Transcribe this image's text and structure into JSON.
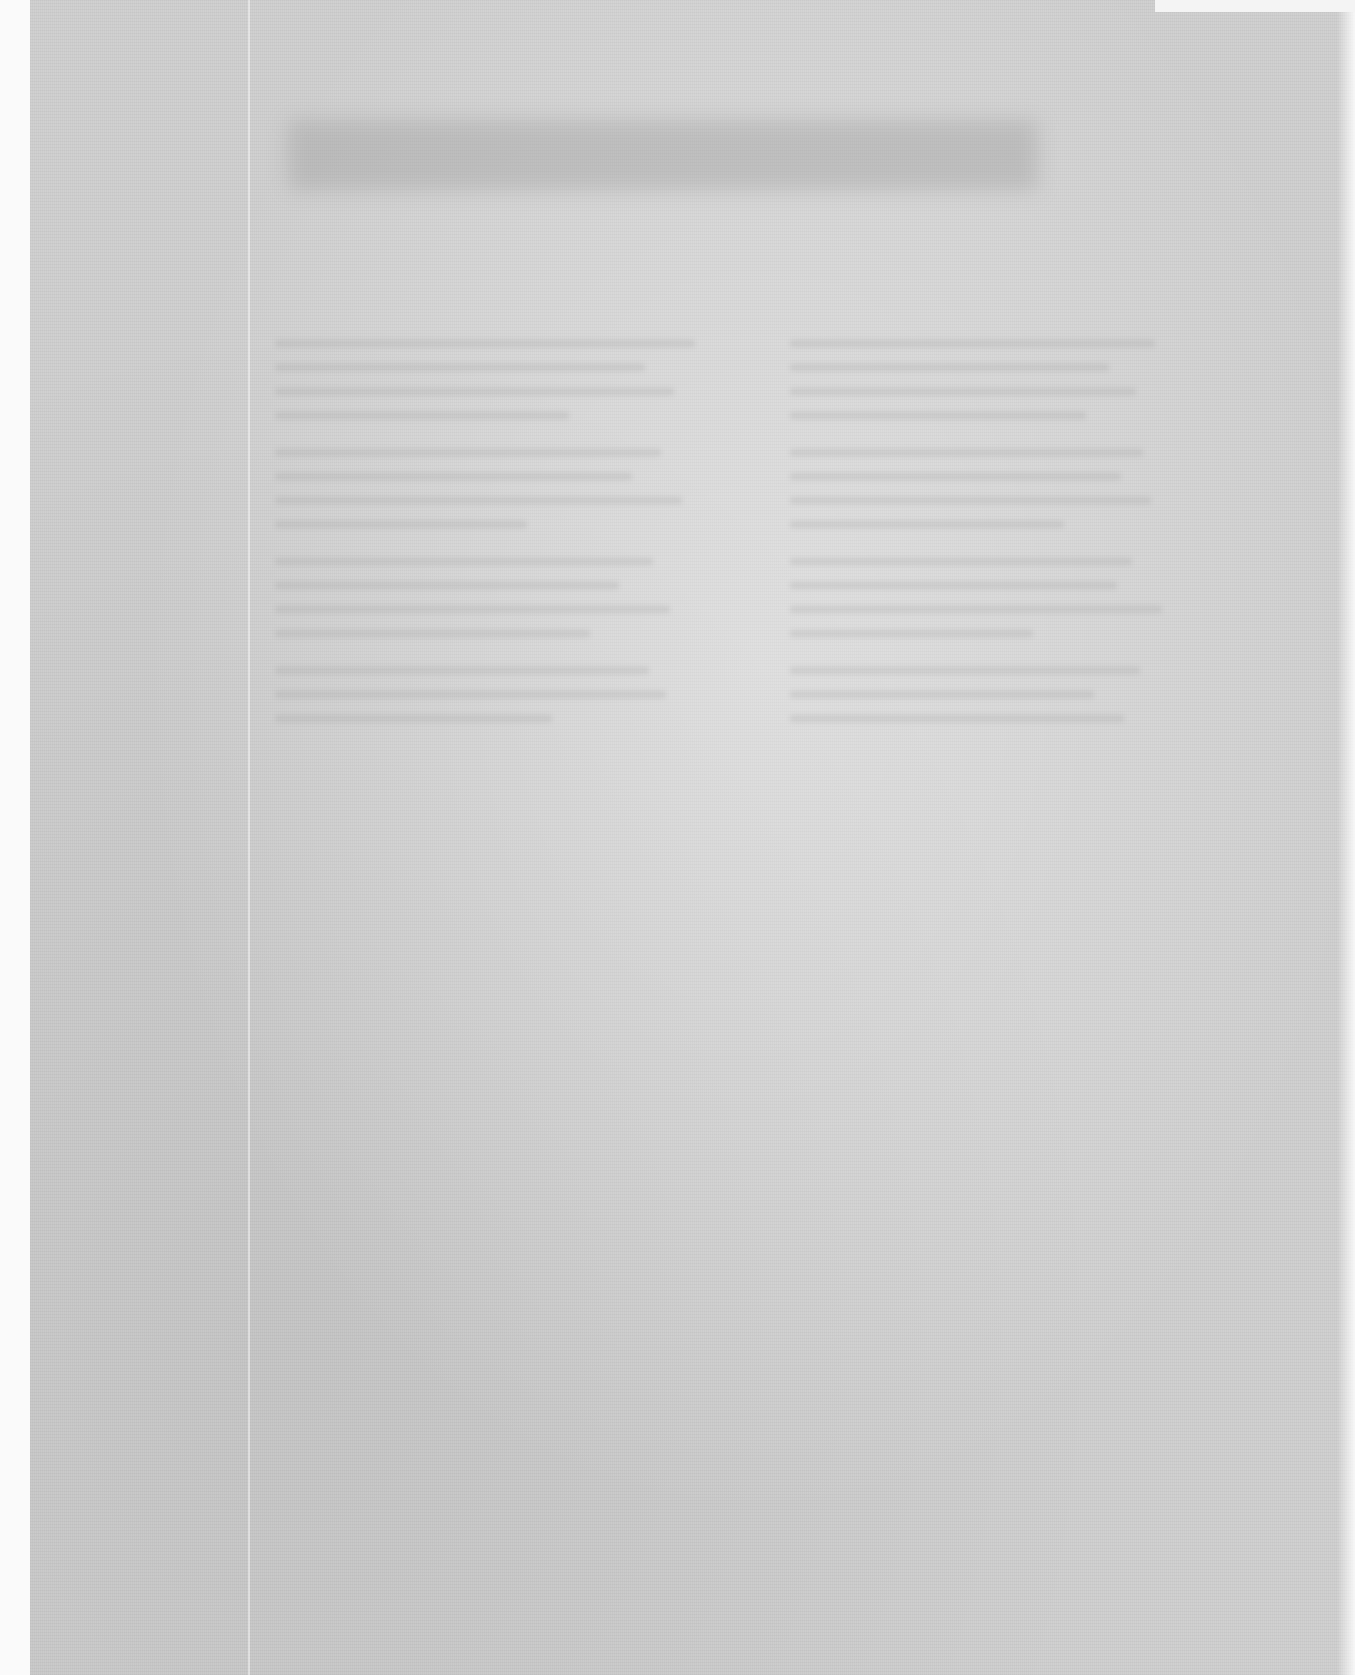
{
  "document": {
    "type": "scanned-page",
    "legibility": "illegible",
    "title": "",
    "body_columns": [
      {
        "lines": []
      },
      {
        "lines": []
      }
    ]
  },
  "colors": {
    "page_background": "#cfcfcf",
    "margin": "#ffffff",
    "header_band": "#969696"
  }
}
